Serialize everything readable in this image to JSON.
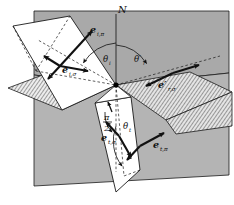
{
  "figure": {
    "background_color": "#ffffff",
    "stroke_color": "#111111",
    "colors": {
      "upper_medium_plane": "#a9a9a9",
      "lower_medium_plane": "#b4b4b4",
      "incident_plane": "#ffffff",
      "transmitted_plane": "#ffffff",
      "interface_hatch": "#e8e8e8",
      "origin_dot": "#000000"
    }
  },
  "labels": {
    "normal": {
      "text": "N",
      "name": "normal-axis-label"
    },
    "e_i_pi": {
      "main": "e",
      "sub": "i,π",
      "name": "incident-pi-vector-label"
    },
    "e_i_sigma": {
      "main": "e",
      "sub": "i,σ",
      "name": "incident-sigma-vector-label"
    },
    "e_r_sigma": {
      "main": "e′",
      "sub": "r,σ",
      "name": "reflected-sigma-vector-label"
    },
    "e_t_sigma": {
      "main": "e",
      "sub": "t,σ",
      "name": "transmitted-sigma-vector-label"
    },
    "e_t_pi": {
      "main": "e",
      "sub": "t,π",
      "name": "transmitted-pi-vector-label"
    },
    "theta_i": {
      "main": "θ",
      "sub": "i",
      "name": "incidence-angle-label"
    },
    "theta_r": {
      "main": "θ′",
      "sub": "r",
      "name": "reflection-angle-label"
    },
    "theta_t": {
      "main": "θ",
      "sub": "t",
      "name": "transmission-angle-label"
    },
    "right_angle": {
      "numerator": "π",
      "denominator": "2",
      "name": "right-angle-label"
    }
  },
  "geometry": {
    "origin": {
      "x": 116,
      "y": 85
    },
    "normal_axis": {
      "x": 116,
      "y_top": 14,
      "y_bottom": 170
    },
    "angles_deg": {
      "incidence": 42,
      "reflection": 42,
      "transmission": 24
    }
  }
}
